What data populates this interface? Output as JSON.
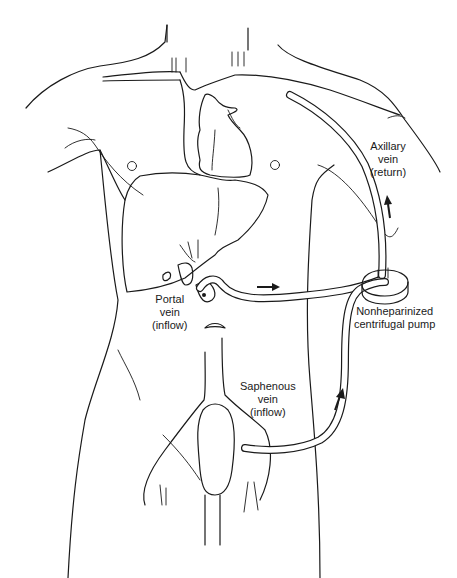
{
  "figure": {
    "line_color": "#1a1a1a",
    "background": "#ffffff"
  },
  "labels": {
    "axillary": {
      "line1": "Axillary",
      "line2": "vein",
      "line3": "(return)"
    },
    "pump": {
      "line1": "Nonheparinized",
      "line2": "centrifugal pump"
    },
    "portal": {
      "line1": "Portal",
      "line2": "vein",
      "line3": "(inflow)"
    },
    "saphenous": {
      "line1": "Saphenous",
      "line2": "vein",
      "line3": "(inflow)"
    }
  },
  "arrows": [
    {
      "name": "portal-flow-arrow",
      "direction": "right"
    },
    {
      "name": "axillary-flow-arrow",
      "direction": "up"
    },
    {
      "name": "saphenous-flow-arrow",
      "direction": "up"
    }
  ]
}
